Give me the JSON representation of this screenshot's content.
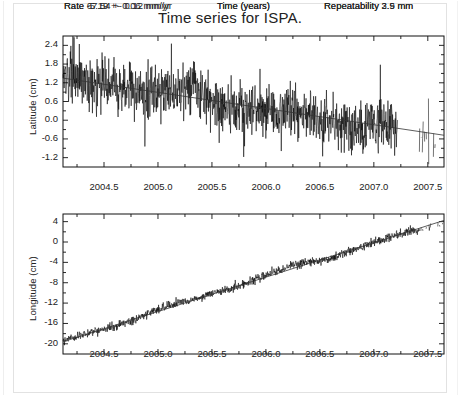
{
  "figure": {
    "title": "Time series for ISPA.",
    "station": "ISPA",
    "background": "#ffffff",
    "ink": "#000000"
  },
  "chart_data": [
    {
      "type": "line",
      "id": "latitude-panel",
      "title": "Time series for ISPA.",
      "xlabel": "Time (years)",
      "ylabel": "Latitude (cm)",
      "xlim": [
        2004.12,
        2007.65
      ],
      "ylim": [
        -1.5,
        2.7
      ],
      "xticks": [
        2004.5,
        2005.0,
        2005.5,
        2006.0,
        2006.5,
        2007.0,
        2007.5
      ],
      "xticklabels": [
        "2004.5",
        "2005.0",
        "2005.5",
        "2006.0",
        "2006.5",
        "2007.0",
        "2007.5"
      ],
      "yticks": [
        2.4,
        1.8,
        1.2,
        0.6,
        0.0,
        -0.6,
        -1.2
      ],
      "yticklabels": [
        "2.4",
        "1.8",
        "1.2",
        "0.6",
        "0.0",
        "-0.6",
        "-1.2"
      ],
      "grid": false,
      "legend": null,
      "annotations": {
        "rate": "Rate -5.19 +- 0.06 mm/yr",
        "center": "Time (years)",
        "repeatability": "Repeatability 2.5 mm"
      },
      "rate_mm_per_yr": -5.19,
      "rate_sigma_mm_per_yr": 0.06,
      "repeatability_mm": 2.5,
      "trend": {
        "intercept_cm": 1.35,
        "slope_cm_per_yr": -0.519,
        "x0": 2004.12
      },
      "scatter_cm": 0.42,
      "data_gaps": [
        [
          2007.22,
          2007.42
        ]
      ],
      "sparse_after": 2007.42,
      "sample_spacing_yr": 0.0027
    },
    {
      "type": "line",
      "id": "longitude-panel",
      "title": "",
      "xlabel": "Time (years)",
      "ylabel": "Longitude (cm)",
      "xlim": [
        2004.12,
        2007.65
      ],
      "ylim": [
        -22.0,
        5.5
      ],
      "xticks": [
        2004.5,
        2005.0,
        2005.5,
        2006.0,
        2006.5,
        2007.0,
        2007.5
      ],
      "xticklabels": [
        "2004.5",
        "2005.0",
        "2005.5",
        "2006.0",
        "2006.5",
        "2007.0",
        "2007.5"
      ],
      "yticks": [
        4,
        0,
        -4,
        -8,
        -12,
        -16,
        -20
      ],
      "yticklabels": [
        "4",
        "0",
        "-4",
        "-8",
        "-12",
        "-16",
        "-20"
      ],
      "grid": false,
      "legend": null,
      "annotations": {
        "rate": "Rate 67.54 +- 0.12 mm/yr",
        "center": "Time (years)",
        "repeatability": "Repeatability 3.9 mm"
      },
      "rate_mm_per_yr": 67.54,
      "rate_sigma_mm_per_yr": 0.12,
      "repeatability_mm": 3.9,
      "trend": {
        "intercept_cm": -19.6,
        "slope_cm_per_yr": 6.754,
        "x0": 2004.12
      },
      "scatter_cm": 0.42,
      "data_gaps": [],
      "sparse_after": 2007.42,
      "sample_spacing_yr": 0.0027
    }
  ],
  "layout": {
    "panels": [
      {
        "id": "latitude-panel",
        "left": 62,
        "top": 35,
        "width": 381,
        "height": 131
      },
      {
        "id": "longitude-panel",
        "left": 62,
        "top": 213,
        "width": 381,
        "height": 140
      }
    ],
    "annotation_rows": [
      {
        "id": "latitude-annotations",
        "top": 193
      },
      {
        "id": "longitude-annotations",
        "top": 360
      }
    ]
  }
}
